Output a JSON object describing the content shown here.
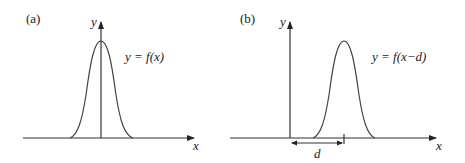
{
  "panels": [
    {
      "id": "a",
      "label": "(a)",
      "y_axis_label": "y",
      "x_axis_label": "x",
      "curve_equation": "y = f(x)"
    },
    {
      "id": "b",
      "label": "(b)",
      "y_axis_label": "y",
      "x_axis_label": "x",
      "curve_equation": "y = f(x−d)",
      "shift_label": "d"
    }
  ],
  "colors": {
    "stroke": "#333333",
    "background": "#ffffff"
  }
}
